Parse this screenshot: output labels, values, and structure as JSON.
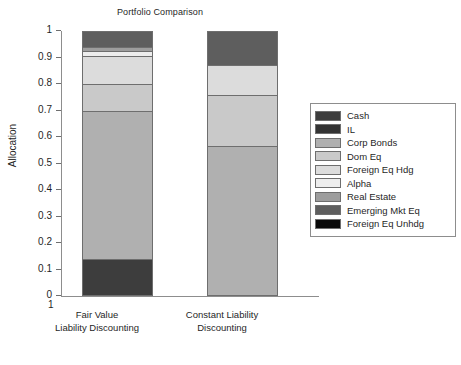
{
  "chart_data": {
    "type": "bar",
    "subtype": "stacked-bar-100",
    "title": "Portfolio Comparison",
    "xlabel": "",
    "ylabel": "Allocation",
    "ylim": [
      0,
      1
    ],
    "yticks": [
      "0",
      "0.1",
      "0.2",
      "0.3",
      "0.4",
      "0.5",
      "0.6",
      "0.7",
      "0.8",
      "0.9",
      "1"
    ],
    "extra_x_tick_label": "1",
    "grid": false,
    "legend_position": "right",
    "categories": [
      "Fair Value\nLiability Discounting",
      "Constant Liability\nDiscounting"
    ],
    "category_lines": [
      [
        "Fair Value",
        "Liability Discounting"
      ],
      [
        "Constant Liability",
        "Discounting"
      ]
    ],
    "series": [
      {
        "name": "Cash",
        "color": "#3d3d3d",
        "values": [
          0.14,
          0.0
        ]
      },
      {
        "name": "IL",
        "color": "#333333",
        "values": [
          0.0,
          0.0
        ]
      },
      {
        "name": "Corp Bonds",
        "color": "#b0b0b0",
        "values": [
          0.56,
          0.565
        ]
      },
      {
        "name": "Dom Eq",
        "color": "#c9c9c9",
        "values": [
          0.1,
          0.195
        ]
      },
      {
        "name": "Foreign Eq Hdg",
        "color": "#dcdcdc",
        "values": [
          0.105,
          0.11
        ]
      },
      {
        "name": "Alpha",
        "color": "#ededed",
        "values": [
          0.02,
          0.0
        ]
      },
      {
        "name": "Real Estate",
        "color": "#9d9d9d",
        "values": [
          0.015,
          0.0
        ]
      },
      {
        "name": "Emerging Mkt Eq",
        "color": "#5e5e5e",
        "values": [
          0.06,
          0.13
        ]
      },
      {
        "name": "Foreign Eq Unhdg",
        "color": "#0a0a0a",
        "values": [
          0.0,
          0.0
        ]
      }
    ]
  },
  "legend": {
    "items": [
      {
        "label": "Cash",
        "color": "#3d3d3d"
      },
      {
        "label": "IL",
        "color": "#333333"
      },
      {
        "label": "Corp Bonds",
        "color": "#b0b0b0"
      },
      {
        "label": "Dom Eq",
        "color": "#c9c9c9"
      },
      {
        "label": "Foreign Eq Hdg",
        "color": "#dcdcdc"
      },
      {
        "label": "Alpha",
        "color": "#ededed"
      },
      {
        "label": "Real Estate",
        "color": "#9d9d9d"
      },
      {
        "label": "Emerging Mkt Eq",
        "color": "#5e5e5e"
      },
      {
        "label": "Foreign Eq Unhdg",
        "color": "#0a0a0a"
      }
    ]
  }
}
